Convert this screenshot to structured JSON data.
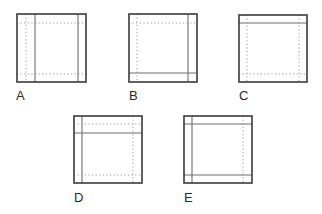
{
  "colors": {
    "outer": "#3a3a3a",
    "solid": "#6e6e6e",
    "dotted": "#9a9a9a",
    "label": "#2a2a2a"
  },
  "figures": [
    {
      "label": "A",
      "box": {
        "x": 17,
        "y": 14,
        "w": 69,
        "h": 68
      },
      "label_pos": {
        "x": 16,
        "y": 100
      },
      "lines": [
        {
          "style": "dotted",
          "x1": 26,
          "y1": 14,
          "x2": 26,
          "y2": 82
        },
        {
          "style": "dotted",
          "x1": 17,
          "y1": 23,
          "x2": 86,
          "y2": 23
        },
        {
          "style": "dotted",
          "x1": 17,
          "y1": 74,
          "x2": 86,
          "y2": 74
        },
        {
          "style": "solid",
          "x1": 35,
          "y1": 14,
          "x2": 35,
          "y2": 82
        },
        {
          "style": "solid",
          "x1": 78,
          "y1": 14,
          "x2": 78,
          "y2": 82
        }
      ]
    },
    {
      "label": "B",
      "box": {
        "x": 129,
        "y": 14,
        "w": 68,
        "h": 68
      },
      "label_pos": {
        "x": 129,
        "y": 100
      },
      "lines": [
        {
          "style": "dotted",
          "x1": 137,
          "y1": 14,
          "x2": 137,
          "y2": 82
        },
        {
          "style": "dotted",
          "x1": 129,
          "y1": 23,
          "x2": 197,
          "y2": 23
        },
        {
          "style": "solid",
          "x1": 188,
          "y1": 14,
          "x2": 188,
          "y2": 82
        },
        {
          "style": "solid",
          "x1": 129,
          "y1": 73,
          "x2": 197,
          "y2": 73
        }
      ]
    },
    {
      "label": "C",
      "box": {
        "x": 239,
        "y": 15,
        "w": 68,
        "h": 67
      },
      "label_pos": {
        "x": 239,
        "y": 100
      },
      "lines": [
        {
          "style": "solid",
          "x1": 239,
          "y1": 23,
          "x2": 307,
          "y2": 23
        },
        {
          "style": "dotted",
          "x1": 247,
          "y1": 15,
          "x2": 247,
          "y2": 82
        },
        {
          "style": "dotted",
          "x1": 299,
          "y1": 15,
          "x2": 299,
          "y2": 82
        },
        {
          "style": "dotted",
          "x1": 239,
          "y1": 74,
          "x2": 307,
          "y2": 74
        }
      ]
    },
    {
      "label": "D",
      "box": {
        "x": 74,
        "y": 116,
        "w": 68,
        "h": 67
      },
      "label_pos": {
        "x": 74,
        "y": 202
      },
      "lines": [
        {
          "style": "solid",
          "x1": 82,
          "y1": 116,
          "x2": 82,
          "y2": 183
        },
        {
          "style": "dotted",
          "x1": 74,
          "y1": 124,
          "x2": 142,
          "y2": 124
        },
        {
          "style": "solid",
          "x1": 74,
          "y1": 133,
          "x2": 142,
          "y2": 133
        },
        {
          "style": "dotted",
          "x1": 133,
          "y1": 116,
          "x2": 133,
          "y2": 183
        },
        {
          "style": "dotted",
          "x1": 74,
          "y1": 175,
          "x2": 142,
          "y2": 175
        }
      ]
    },
    {
      "label": "E",
      "box": {
        "x": 184,
        "y": 116,
        "w": 68,
        "h": 67
      },
      "label_pos": {
        "x": 184,
        "y": 202
      },
      "lines": [
        {
          "style": "solid",
          "x1": 192,
          "y1": 116,
          "x2": 192,
          "y2": 183
        },
        {
          "style": "solid",
          "x1": 184,
          "y1": 124,
          "x2": 252,
          "y2": 124
        },
        {
          "style": "dotted",
          "x1": 243,
          "y1": 116,
          "x2": 243,
          "y2": 183
        },
        {
          "style": "solid",
          "x1": 184,
          "y1": 175,
          "x2": 252,
          "y2": 175
        }
      ]
    }
  ]
}
